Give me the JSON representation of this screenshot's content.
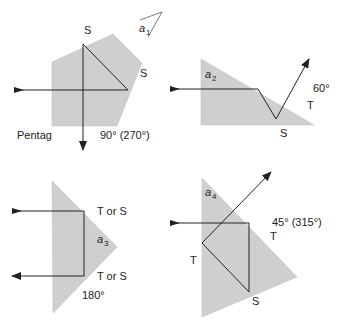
{
  "colors": {
    "prism_fill": "#cfcfcf",
    "line": "#222222"
  },
  "panels": [
    {
      "name": "pentagonal-prism",
      "caption": "Pentag",
      "angle": "90° (270°)",
      "labels": {
        "top": "S",
        "right": "S"
      },
      "angle_marker": "a",
      "angle_sub": "1"
    },
    {
      "name": "right-angle-prism-60",
      "angle": "60°",
      "labels": {
        "t": "T",
        "s": "S"
      },
      "angle_marker": "a",
      "angle_sub": "2"
    },
    {
      "name": "porro-prism-180",
      "angle": "180°",
      "labels": {
        "top": "T or S",
        "bottom": "T or S"
      },
      "angle_marker": "a",
      "angle_sub": "3"
    },
    {
      "name": "prism-45",
      "angle": "45° (315°)",
      "labels": {
        "right": "T",
        "left": "T",
        "bottom": "S"
      },
      "angle_marker": "a",
      "angle_sub": "4"
    }
  ]
}
